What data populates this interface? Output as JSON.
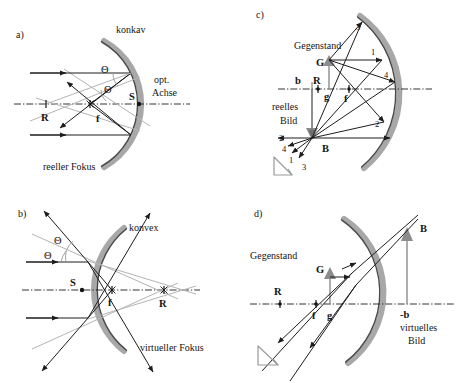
{
  "figure": {
    "background_color": "#ffffff",
    "ink_color": "#141414",
    "mirror_color": "#a8a8a8",
    "light_ray_color": "#b4b4b4"
  },
  "panels": {
    "a": {
      "tag": "a)",
      "mirror_label": "konkav",
      "axis_label_line1": "opt.",
      "axis_label_line2": "Achse",
      "focus_label": "reeller Fokus",
      "points": {
        "vertex": "S",
        "focus": "f",
        "center": "R"
      },
      "angles": {
        "incident": "Θ",
        "reflected": "Θ"
      }
    },
    "b": {
      "tag": "b)",
      "mirror_label": "konvex",
      "focus_label": "virtueller Fokus",
      "points": {
        "vertex": "S",
        "focus": "f",
        "center": "R"
      },
      "angles": {
        "incident": "Θ",
        "reflected": "Θ"
      }
    },
    "c": {
      "tag": "c)",
      "object_label": "Gegenstand",
      "image_label_line1": "reelles",
      "image_label_line2": "Bild",
      "points": {
        "object_tip": "G",
        "image_tip": "B",
        "center": "R",
        "focus": "f",
        "object_distance": "g",
        "image_distance": "b"
      },
      "ray_numbers_mirror": [
        "3",
        "1",
        "4",
        "2"
      ],
      "ray_numbers_image": [
        "2",
        "4",
        "1",
        "3"
      ]
    },
    "d": {
      "tag": "d)",
      "object_label": "Gegenstand",
      "image_label_line1": "virtuelles",
      "image_label_line2": "Bild",
      "points": {
        "object_tip": "G",
        "image_tip": "B",
        "center": "R",
        "focus": "f",
        "object_distance": "g",
        "image_distance": "-b"
      }
    }
  }
}
